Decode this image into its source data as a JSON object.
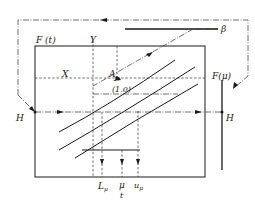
{
  "diagram": {
    "type": "nomogram-flow",
    "labels": {
      "F_t": "F (t)",
      "Y": "Y",
      "X": "X",
      "A": "A",
      "one_zero": "(1.0)",
      "beta": "β",
      "F_mu": "F(μ)",
      "H_left": "H",
      "H_right": "H",
      "L_mu": "L",
      "L_mu_sub": "μ",
      "mu": "μ",
      "t": "t",
      "u_mu": "u",
      "u_mu_sub": "μ"
    },
    "elements": [
      {
        "name": "main-frame",
        "kind": "rectangle"
      },
      {
        "name": "outer-loop",
        "kind": "dash-dot path with arrows",
        "connects": [
          "β line",
          "F(μ) / H right",
          "H left"
        ]
      },
      {
        "name": "beta-line",
        "kind": "horizontal solid line",
        "label": "β"
      },
      {
        "name": "beta-diagonal",
        "kind": "dash-dot diagonal with arrows",
        "from": "β",
        "to": "A"
      },
      {
        "name": "x-line",
        "kind": "horizontal dashed",
        "label": "X"
      },
      {
        "name": "y-line",
        "kind": "vertical dashed",
        "label": "Y"
      },
      {
        "name": "point-a",
        "kind": "point",
        "label": "A"
      },
      {
        "name": "h-line",
        "kind": "horizontal dash-dot with arrows",
        "label": "H"
      },
      {
        "name": "f-mu-axis",
        "kind": "vertical solid line",
        "label": "F(μ)"
      },
      {
        "name": "curves",
        "kind": "three parallel curves"
      },
      {
        "name": "drop-lines",
        "kind": "vertical dashed with arrows",
        "labels": [
          "Lμ",
          "μ / t",
          "uμ"
        ]
      }
    ],
    "colors": {
      "stroke": "#1a1a1a",
      "background": "#ffffff"
    }
  }
}
